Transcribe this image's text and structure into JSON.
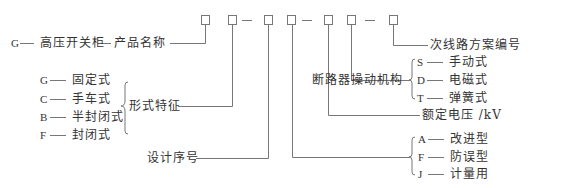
{
  "diagram": {
    "code_boxes": [
      "□",
      "□",
      "□",
      "□",
      "□",
      "□",
      "□"
    ],
    "separators": [
      "—",
      "—",
      "—"
    ],
    "product_name": {
      "code": "G",
      "label": "高压开关柜",
      "meaning": "产品名称"
    },
    "form_features": {
      "label": "形式特征",
      "options": [
        {
          "code": "G",
          "label": "固定式"
        },
        {
          "code": "C",
          "label": "手车式"
        },
        {
          "code": "B",
          "label": "半封闭式"
        },
        {
          "code": "F",
          "label": "封闭式"
        }
      ]
    },
    "design_serial": {
      "label": "设计序号"
    },
    "variant": {
      "options": [
        {
          "code": "A",
          "label": "改进型"
        },
        {
          "code": "F",
          "label": "防误型"
        },
        {
          "code": "J",
          "label": "计量用"
        }
      ]
    },
    "rated_voltage": {
      "label": "额定电压 /kV"
    },
    "breaker_mechanism": {
      "label": "断路器操动机构",
      "options": [
        {
          "code": "S",
          "label": "手动式"
        },
        {
          "code": "D",
          "label": "电磁式"
        },
        {
          "code": "T",
          "label": "弹簧式"
        }
      ]
    },
    "secondary_circuit": {
      "label": "次线路方案编号"
    }
  }
}
